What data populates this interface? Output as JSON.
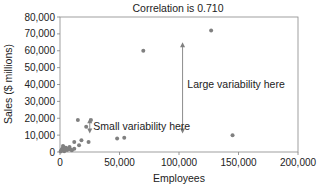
{
  "chart_data": {
    "type": "scatter",
    "title": "Correlation is 0.710",
    "xlabel": "Employees",
    "ylabel": "Sales ($ millions)",
    "xlim": [
      0,
      200000
    ],
    "ylim": [
      0,
      80000
    ],
    "grid": false,
    "legend": null,
    "x_ticks": [
      "0",
      "50,000",
      "100,000",
      "150,000",
      "200,000"
    ],
    "x_tick_values": [
      0,
      50000,
      100000,
      150000,
      200000
    ],
    "y_ticks": [
      "0",
      "10,000",
      "20,000",
      "30,000",
      "40,000",
      "50,000",
      "60,000",
      "70,000",
      "80,000"
    ],
    "y_tick_values": [
      0,
      10000,
      20000,
      30000,
      40000,
      50000,
      60000,
      70000,
      80000
    ],
    "series": [
      {
        "name": "Companies",
        "points": [
          [
            70000,
            60000
          ],
          [
            127000,
            72000
          ],
          [
            145000,
            10000
          ],
          [
            15000,
            19000
          ],
          [
            26000,
            19000
          ],
          [
            22000,
            15000
          ],
          [
            48000,
            8000
          ],
          [
            54000,
            8500
          ],
          [
            12000,
            6000
          ],
          [
            18000,
            7000
          ],
          [
            16000,
            4000
          ],
          [
            24000,
            6000
          ],
          [
            3000,
            3000
          ],
          [
            5000,
            2500
          ],
          [
            2000,
            2000
          ],
          [
            7000,
            2000
          ],
          [
            9000,
            1500
          ],
          [
            4000,
            1000
          ],
          [
            1000,
            800
          ],
          [
            6000,
            1200
          ],
          [
            10000,
            1000
          ],
          [
            2500,
            3500
          ],
          [
            8000,
            3000
          ],
          [
            1500,
            1500
          ],
          [
            500,
            300
          ],
          [
            3500,
            500
          ],
          [
            12000,
            2000
          ]
        ]
      }
    ],
    "annotations": [
      {
        "text": "Large variability here",
        "type": "double-arrow",
        "x": 103000,
        "y_from": 11000,
        "y_to": 65000,
        "label_x": 107000,
        "label_y": 40000
      },
      {
        "text": "Small variability here",
        "type": "double-arrow",
        "x": 25000,
        "y_from": 11000,
        "y_to": 20000,
        "label_x": 28000,
        "label_y": 15000
      }
    ]
  },
  "colors": {
    "point": "#808080",
    "axis": "#808080",
    "text": "#222222",
    "arrow": "#808080"
  }
}
